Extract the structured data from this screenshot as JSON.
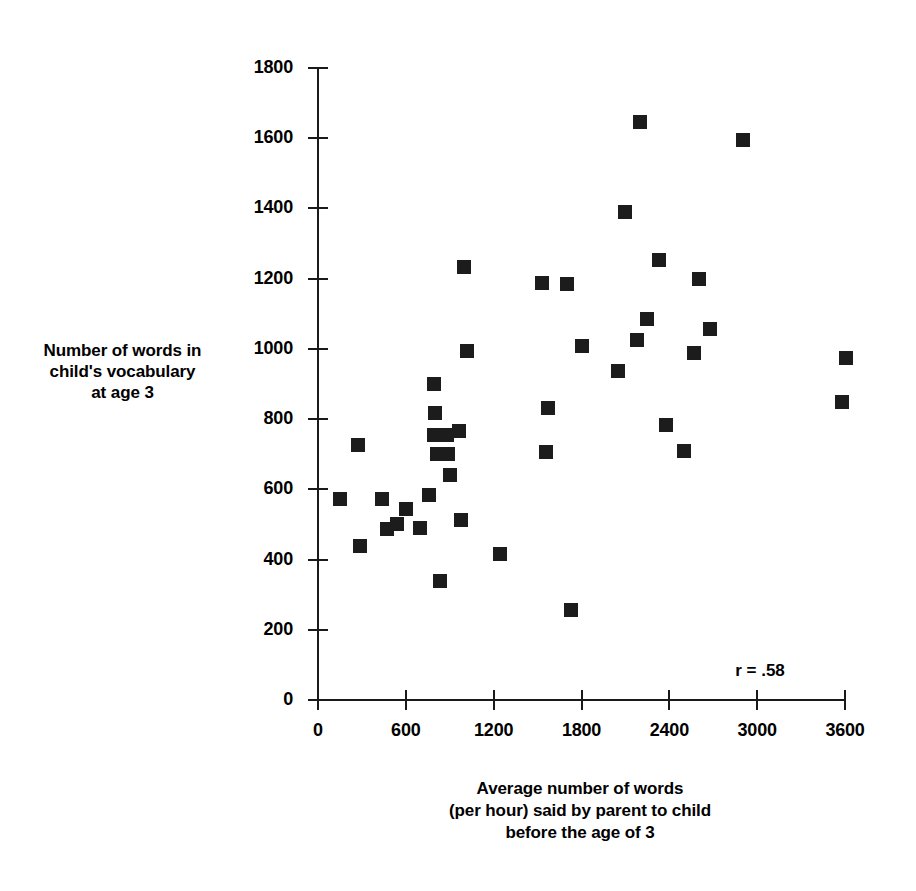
{
  "chart_data": {
    "type": "scatter",
    "title": "",
    "xlabel": "Average number of words (per hour) said by parent to child before the age of 3",
    "ylabel": "Number of words in child's vocabulary at age 3",
    "xlabel_lines": [
      "Average number of words",
      "(per hour) said by parent to child",
      "before the age of 3"
    ],
    "ylabel_lines": [
      "Number of words in",
      "child's vocabulary",
      "at age 3"
    ],
    "xlim": [
      0,
      3600
    ],
    "ylim": [
      0,
      1800
    ],
    "xticks": [
      0,
      600,
      1200,
      1800,
      2400,
      3000,
      3600
    ],
    "yticks": [
      0,
      200,
      400,
      600,
      800,
      1000,
      1200,
      1400,
      1600,
      1800
    ],
    "xtick_labels": [
      "0",
      "600",
      "1200",
      "1800",
      "2400",
      "3000",
      "3600"
    ],
    "ytick_labels": [
      "0",
      "200",
      "400",
      "600",
      "800",
      "1000",
      "1200",
      "1400",
      "1600",
      "1800"
    ],
    "grid": false,
    "legend": false,
    "marker": "square",
    "marker_color": "#1c1c1c",
    "annotation": "r = .58",
    "correlation": 0.58,
    "n_points": 42,
    "points": [
      [
        150,
        572
      ],
      [
        270,
        725
      ],
      [
        290,
        438
      ],
      [
        440,
        572
      ],
      [
        470,
        487
      ],
      [
        540,
        500
      ],
      [
        600,
        545
      ],
      [
        700,
        490
      ],
      [
        760,
        583
      ],
      [
        790,
        900
      ],
      [
        790,
        755
      ],
      [
        800,
        818
      ],
      [
        810,
        700
      ],
      [
        830,
        340
      ],
      [
        880,
        755
      ],
      [
        890,
        700
      ],
      [
        900,
        640
      ],
      [
        960,
        765
      ],
      [
        980,
        512
      ],
      [
        1000,
        1233
      ],
      [
        1020,
        995
      ],
      [
        1240,
        415
      ],
      [
        1530,
        1188
      ],
      [
        1560,
        705
      ],
      [
        1570,
        833
      ],
      [
        1700,
        1186
      ],
      [
        1730,
        255
      ],
      [
        1800,
        1008
      ],
      [
        2050,
        938
      ],
      [
        2100,
        1390
      ],
      [
        2180,
        1025
      ],
      [
        2200,
        1645
      ],
      [
        2250,
        1085
      ],
      [
        2330,
        1252
      ],
      [
        2380,
        783
      ],
      [
        2500,
        710
      ],
      [
        2570,
        988
      ],
      [
        2600,
        1198
      ],
      [
        2680,
        1058
      ],
      [
        2900,
        1595
      ],
      [
        3580,
        848
      ],
      [
        3610,
        975
      ]
    ]
  },
  "axes": {
    "origin_px": [
      318,
      700
    ],
    "x_max_px": 845,
    "y_max_px": 68
  }
}
